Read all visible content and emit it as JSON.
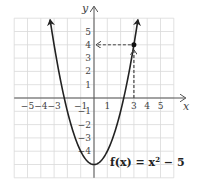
{
  "chart_data": {
    "type": "line",
    "title": "",
    "function_label": "f(x) = x² − 5",
    "function_label_parts": {
      "name": "f(x) = x",
      "exp": "2",
      "rest": " − 5"
    },
    "xlabel": "x",
    "ylabel": "y",
    "xlim": [
      -6,
      6
    ],
    "ylim": [
      -6,
      6
    ],
    "grid": true,
    "x_ticks": [
      -5,
      -4,
      -3,
      -1,
      1,
      3,
      4,
      5
    ],
    "x_tick_labels": [
      "−5",
      "−4",
      "−3",
      "−1",
      "1",
      "3",
      "4",
      "5"
    ],
    "y_ticks": [
      5,
      4,
      3,
      2,
      1,
      -1,
      -2,
      -3,
      -4
    ],
    "y_tick_labels": [
      "5",
      "4",
      "3",
      "2",
      "1",
      "−1",
      "−2",
      "−3",
      "−4"
    ],
    "series": [
      {
        "name": "f(x) = x^2 - 5",
        "x": [
          -3.3,
          -3,
          -2,
          -1,
          0,
          1,
          2,
          3,
          3.3
        ],
        "y": [
          5.89,
          4,
          -1,
          -4,
          -5,
          -4,
          -1,
          4,
          5.89
        ]
      }
    ],
    "highlight_point": {
      "x": 3,
      "y": 4
    },
    "annotations": [
      {
        "type": "dashed-arrow",
        "from": [
          3,
          0
        ],
        "to": [
          3,
          4
        ],
        "direction": "up"
      },
      {
        "type": "dashed-arrow",
        "from": [
          3,
          4
        ],
        "to": [
          0,
          4
        ],
        "direction": "left"
      }
    ],
    "colors": {
      "curve": "#222222",
      "grid": "#d9d9d9",
      "axis": "#555555"
    }
  }
}
